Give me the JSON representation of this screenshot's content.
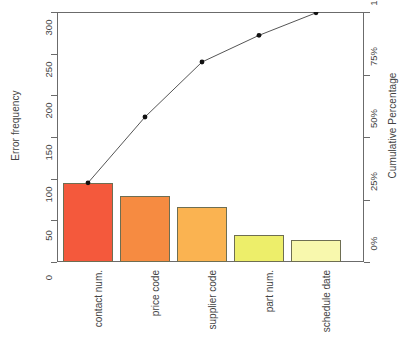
{
  "chart_data": {
    "type": "bar",
    "title": "",
    "subtitle": "",
    "categories": [
      "contact num.",
      "price code",
      "supplier code",
      "part num.",
      "schedule date"
    ],
    "values": [
      95,
      79,
      66,
      32,
      27
    ],
    "xlabel": "",
    "ylabel": "Error frequency",
    "ylabel_right": "Cumulative Percentage",
    "ylim": [
      0,
      300
    ],
    "yticks": [
      0,
      50,
      100,
      150,
      200,
      250,
      300
    ],
    "ytick_labels": [
      "0",
      "50",
      "100",
      "150",
      "200",
      "250",
      "300"
    ],
    "ylim_right": [
      0,
      100
    ],
    "yticks_right": [
      0,
      25,
      50,
      75,
      100
    ],
    "ytick_labels_right": [
      "0%",
      "25%",
      "50%",
      "75%",
      "100%"
    ],
    "grid": false,
    "legend": "none",
    "series": [
      {
        "name": "Error frequency",
        "type": "bar",
        "values": [
          95,
          79,
          66,
          32,
          27
        ],
        "colors": [
          "#F4593C",
          "#F68B41",
          "#FAB351",
          "#EDEE6A",
          "#F8F8AD"
        ]
      },
      {
        "name": "Cumulative Percentage",
        "type": "line",
        "values": [
          95,
          174,
          240,
          272,
          299
        ],
        "percentages": [
          31.7,
          58.0,
          80.0,
          90.7,
          99.7
        ],
        "color": "#555555",
        "marker": "filled-circle"
      }
    ],
    "bar_border_color": "#6E6E52",
    "axis_color": "#6B6B6B"
  },
  "axes": {
    "left_title": "Error frequency",
    "right_title": "Cumulative Percentage"
  }
}
